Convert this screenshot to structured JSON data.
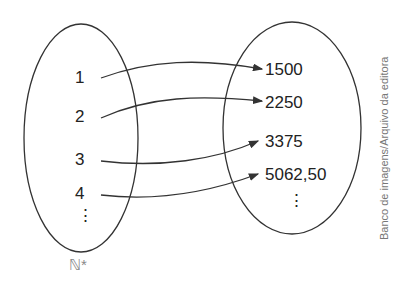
{
  "domain_sets": {
    "left": {
      "name": "ℕ*",
      "elements": [
        "1",
        "2",
        "3",
        "4",
        "⋮"
      ]
    },
    "right": {
      "elements": [
        "1500",
        "2250",
        "3375",
        "5062,50",
        "⋮"
      ]
    }
  },
  "mappings": [
    {
      "from": "1",
      "to": "1500"
    },
    {
      "from": "2",
      "to": "2250"
    },
    {
      "from": "3",
      "to": "3375"
    },
    {
      "from": "4",
      "to": "5062,50"
    }
  ],
  "credit": "Banco de imagens/Arquivo da editora",
  "colors": {
    "stroke": "#333333",
    "text": "#222222",
    "credit": "#777777"
  }
}
